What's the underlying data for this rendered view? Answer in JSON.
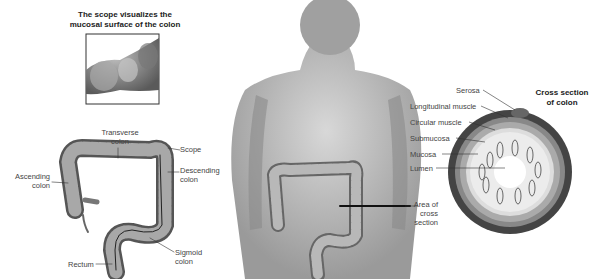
{
  "figure": {
    "inset": {
      "title_line1": "The scope visualizes the",
      "title_line2": "mucosal surface of the colon"
    },
    "colon_labels": {
      "transverse_line1": "Transverse",
      "transverse_line2": "colon",
      "scope": "Scope",
      "ascending_line1": "Ascending",
      "ascending_line2": "colon",
      "descending_line1": "Descending",
      "descending_line2": "colon",
      "sigmoid_line1": "Sigmoid",
      "sigmoid_line2": "colon",
      "rectum": "Rectum"
    },
    "body_labels": {
      "area_line1": "Area of",
      "area_line2": "cross",
      "area_line3": "section"
    },
    "cross_section": {
      "title_line1": "Cross section",
      "title_line2": "of colon",
      "layers": [
        "Serosa",
        "Longitudinal muscle",
        "Circular muscle",
        "Submucosa",
        "Mucosa",
        "Lumen"
      ]
    }
  }
}
